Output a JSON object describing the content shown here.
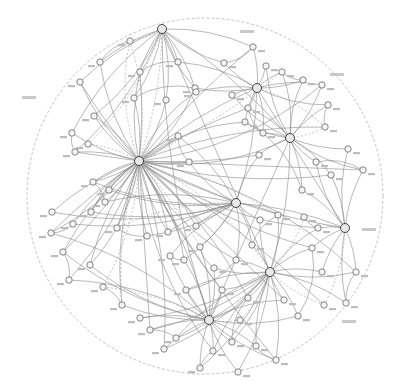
{
  "diagram": {
    "type": "radial network / concept map",
    "background": "#ffffff",
    "line_color": "#8a8a8a",
    "boundary": {
      "cx": 205,
      "cy": 196,
      "r": 178,
      "style": "dashed"
    },
    "hubs": [
      {
        "id": "h1",
        "x": 139,
        "y": 161
      },
      {
        "id": "h2",
        "x": 162,
        "y": 29
      },
      {
        "id": "h3",
        "x": 257,
        "y": 88
      },
      {
        "id": "h4",
        "x": 290,
        "y": 138
      },
      {
        "id": "h5",
        "x": 236,
        "y": 203
      },
      {
        "id": "h6",
        "x": 270,
        "y": 272
      },
      {
        "id": "h7",
        "x": 345,
        "y": 228
      },
      {
        "id": "h8",
        "x": 209,
        "y": 320
      }
    ],
    "nodes": [
      {
        "x": 130,
        "y": 41
      },
      {
        "x": 100,
        "y": 62
      },
      {
        "x": 80,
        "y": 82
      },
      {
        "x": 178,
        "y": 62
      },
      {
        "x": 140,
        "y": 72
      },
      {
        "x": 166,
        "y": 100
      },
      {
        "x": 195,
        "y": 88
      },
      {
        "x": 134,
        "y": 98
      },
      {
        "x": 94,
        "y": 116
      },
      {
        "x": 72,
        "y": 133
      },
      {
        "x": 75,
        "y": 152
      },
      {
        "x": 88,
        "y": 144
      },
      {
        "x": 178,
        "y": 136
      },
      {
        "x": 189,
        "y": 162
      },
      {
        "x": 196,
        "y": 92
      },
      {
        "x": 224,
        "y": 63
      },
      {
        "x": 253,
        "y": 47
      },
      {
        "x": 266,
        "y": 66
      },
      {
        "x": 282,
        "y": 72
      },
      {
        "x": 303,
        "y": 80
      },
      {
        "x": 322,
        "y": 85
      },
      {
        "x": 328,
        "y": 105
      },
      {
        "x": 325,
        "y": 127
      },
      {
        "x": 348,
        "y": 149
      },
      {
        "x": 363,
        "y": 170
      },
      {
        "x": 316,
        "y": 162
      },
      {
        "x": 331,
        "y": 175
      },
      {
        "x": 302,
        "y": 190
      },
      {
        "x": 245,
        "y": 122
      },
      {
        "x": 232,
        "y": 95
      },
      {
        "x": 248,
        "y": 108
      },
      {
        "x": 263,
        "y": 133
      },
      {
        "x": 259,
        "y": 155
      },
      {
        "x": 304,
        "y": 217
      },
      {
        "x": 318,
        "y": 228
      },
      {
        "x": 260,
        "y": 220
      },
      {
        "x": 278,
        "y": 215
      },
      {
        "x": 252,
        "y": 245
      },
      {
        "x": 284,
        "y": 300
      },
      {
        "x": 298,
        "y": 316
      },
      {
        "x": 312,
        "y": 248
      },
      {
        "x": 322,
        "y": 272
      },
      {
        "x": 356,
        "y": 272
      },
      {
        "x": 346,
        "y": 303
      },
      {
        "x": 324,
        "y": 305
      },
      {
        "x": 256,
        "y": 346
      },
      {
        "x": 276,
        "y": 360
      },
      {
        "x": 238,
        "y": 372
      },
      {
        "x": 213,
        "y": 351
      },
      {
        "x": 200,
        "y": 368
      },
      {
        "x": 164,
        "y": 349
      },
      {
        "x": 176,
        "y": 338
      },
      {
        "x": 150,
        "y": 330
      },
      {
        "x": 140,
        "y": 318
      },
      {
        "x": 122,
        "y": 305
      },
      {
        "x": 103,
        "y": 287
      },
      {
        "x": 90,
        "y": 265
      },
      {
        "x": 69,
        "y": 280
      },
      {
        "x": 63,
        "y": 252
      },
      {
        "x": 52,
        "y": 212
      },
      {
        "x": 51,
        "y": 233
      },
      {
        "x": 73,
        "y": 224
      },
      {
        "x": 91,
        "y": 212
      },
      {
        "x": 105,
        "y": 202
      },
      {
        "x": 93,
        "y": 182
      },
      {
        "x": 109,
        "y": 190
      },
      {
        "x": 117,
        "y": 228
      },
      {
        "x": 147,
        "y": 236
      },
      {
        "x": 168,
        "y": 232
      },
      {
        "x": 170,
        "y": 256
      },
      {
        "x": 184,
        "y": 260
      },
      {
        "x": 196,
        "y": 226
      },
      {
        "x": 200,
        "y": 247
      },
      {
        "x": 214,
        "y": 268
      },
      {
        "x": 222,
        "y": 290
      },
      {
        "x": 186,
        "y": 290
      },
      {
        "x": 236,
        "y": 260
      },
      {
        "x": 240,
        "y": 320
      },
      {
        "x": 248,
        "y": 298
      },
      {
        "x": 232,
        "y": 342
      }
    ]
  }
}
